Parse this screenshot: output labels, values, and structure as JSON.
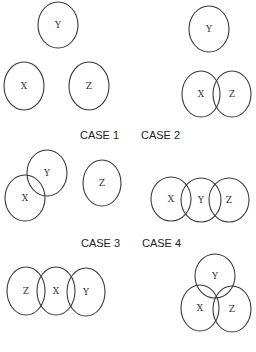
{
  "diagram": {
    "stroke_color": "#3a3a3a",
    "background": "#ffffff",
    "cases": [
      {
        "label": "CASE 1",
        "label_pos": [
          80,
          139
        ],
        "circles": [
          {
            "name": "Y",
            "cx": 58,
            "cy": 25,
            "rx": 20,
            "ry": 23
          },
          {
            "name": "X",
            "cx": 24,
            "cy": 86,
            "rx": 20,
            "ry": 24
          },
          {
            "name": "Z",
            "cx": 89,
            "cy": 86,
            "rx": 20,
            "ry": 24
          }
        ]
      },
      {
        "label": "CASE 2",
        "label_pos": [
          141,
          139
        ],
        "circles": [
          {
            "name": "Y",
            "cx": 209,
            "cy": 29,
            "rx": 20,
            "ry": 23
          },
          {
            "name": "X",
            "cx": 201,
            "cy": 94,
            "rx": 19,
            "ry": 23
          },
          {
            "name": "Z",
            "cx": 232,
            "cy": 94,
            "rx": 19,
            "ry": 23
          }
        ]
      },
      {
        "label": "CASE 3",
        "label_pos": [
          81,
          247
        ],
        "circles": [
          {
            "name": "Y",
            "cx": 47,
            "cy": 173,
            "rx": 20,
            "ry": 23
          },
          {
            "name": "X",
            "cx": 25,
            "cy": 198,
            "rx": 20,
            "ry": 23
          },
          {
            "name": "Z",
            "cx": 102,
            "cy": 183,
            "rx": 19,
            "ry": 23
          }
        ]
      },
      {
        "label": "CASE 4",
        "label_pos": [
          142,
          247
        ],
        "circles": [
          {
            "name": "X",
            "cx": 171,
            "cy": 199,
            "rx": 20,
            "ry": 22
          },
          {
            "name": "Y",
            "cx": 201,
            "cy": 200,
            "rx": 20,
            "ry": 22
          },
          {
            "name": "Z",
            "cx": 229,
            "cy": 200,
            "rx": 20,
            "ry": 22
          }
        ]
      },
      {
        "label": "",
        "label_pos": null,
        "circles": [
          {
            "name": "Z",
            "cx": 26,
            "cy": 291,
            "rx": 19,
            "ry": 24
          },
          {
            "name": "X",
            "cx": 56,
            "cy": 291,
            "rx": 19,
            "ry": 24
          },
          {
            "name": "Y",
            "cx": 86,
            "cy": 292,
            "rx": 19,
            "ry": 24
          }
        ]
      },
      {
        "label": "",
        "label_pos": null,
        "circles": [
          {
            "name": "Y",
            "cx": 215,
            "cy": 276,
            "rx": 20,
            "ry": 22
          },
          {
            "name": "X",
            "cx": 200,
            "cy": 308,
            "rx": 19,
            "ry": 23
          },
          {
            "name": "Z",
            "cx": 232,
            "cy": 309,
            "rx": 19,
            "ry": 23
          }
        ]
      }
    ]
  }
}
